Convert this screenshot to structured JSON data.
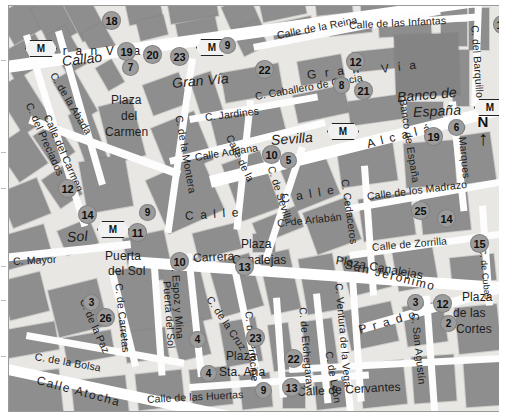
{
  "map": {
    "title": "Madrid city centre street map",
    "compass": {
      "label": "N",
      "arrow": "↑"
    },
    "metro_symbol": "M",
    "colors": {
      "background": "#e9e7e4",
      "block": "#8e8e8e",
      "road": "#fdfdfd",
      "poi_fill": "#9c9c9c",
      "text": "#1d1d1d"
    }
  },
  "streets": [
    {
      "id": "gran-via-1",
      "text": "G r a n   V i a"
    },
    {
      "id": "gran-via-2",
      "text": "Gran Vía"
    },
    {
      "id": "gran-via-3",
      "text": "G r a n"
    },
    {
      "id": "gran-via-4",
      "text": "V í a"
    },
    {
      "id": "callao",
      "text": "Callao"
    },
    {
      "id": "c-de-la-abada",
      "text": "C. de la Abada"
    },
    {
      "id": "calle-del-carmen",
      "text": "Calle  del  Carmen"
    },
    {
      "id": "c-del-preciados",
      "text": "C. del Preciados"
    },
    {
      "id": "c-de-la-montera",
      "text": "C. de la Montera"
    },
    {
      "id": "c-jardines",
      "text": "C. Jardines"
    },
    {
      "id": "calle-aduana",
      "text": "Calle Aduana"
    },
    {
      "id": "calle-de-la",
      "text": "Calle de la"
    },
    {
      "id": "calle",
      "text": "C a l l e"
    },
    {
      "id": "calle-de-la-reina",
      "text": "Calle  de  la  Reina"
    },
    {
      "id": "calle-infantas",
      "text": "Calle de las Infantas"
    },
    {
      "id": "c-caballero-gracia",
      "text": "C. Caballero de Gracia"
    },
    {
      "id": "banco-de-espana",
      "text": "Banco de España"
    },
    {
      "id": "c-del-barquillo",
      "text": "C. del Barquillo"
    },
    {
      "id": "c-marques",
      "text": "C. Marques"
    },
    {
      "id": "sevilla",
      "text": "Sevilla"
    },
    {
      "id": "alcala",
      "text": "A l c a l á"
    },
    {
      "id": "c-de-sevilla",
      "text": "C. de Sevilla"
    },
    {
      "id": "c-de-arlaban",
      "text": "C. de Arlabán"
    },
    {
      "id": "c-cedaceros",
      "text": "C. Cedaceros"
    },
    {
      "id": "calle-madrazo",
      "text": "Calle de los Madrazo"
    },
    {
      "id": "calle-zorrilla",
      "text": "Calle de Zorrilla"
    },
    {
      "id": "sol",
      "text": "Sol"
    },
    {
      "id": "puerta-del-sol",
      "text": "Puerta del Sol"
    },
    {
      "id": "c-mayor",
      "text": "C. Mayor"
    },
    {
      "id": "c-espoz-y-mina",
      "text": "C. Espoz y Mina"
    },
    {
      "id": "carrera",
      "text": "Carrera"
    },
    {
      "id": "plaza-canalejas",
      "text": "Plaza Canalejas"
    },
    {
      "id": "san-jeronimo",
      "text": "San  Jerónimo"
    },
    {
      "id": "c-de-la-cruz",
      "text": "C. de la Cruz"
    },
    {
      "id": "c-de-carretas",
      "text": "C. de Carretas"
    },
    {
      "id": "c-de-la-paz",
      "text": "C. de la Paz"
    },
    {
      "id": "c-de-la-bolsa",
      "text": "C. de la Bolsa"
    },
    {
      "id": "calle-atocha",
      "text": "Calle  Atocha"
    },
    {
      "id": "calle-huertas",
      "text": "Calle de las Huertas"
    },
    {
      "id": "plaza-sta-ana",
      "text": "Plaza Sta. Ana"
    },
    {
      "id": "c-del-principe",
      "text": "C. del Príncipe"
    },
    {
      "id": "c-de-etchegaray",
      "text": "C. de Etchegaray"
    },
    {
      "id": "c-ventura-de-la-vega",
      "text": "C. Ventura de la Vega"
    },
    {
      "id": "c-de-leon",
      "text": "C. de León"
    },
    {
      "id": "prado",
      "text": "P r a d o"
    },
    {
      "id": "c-san-agustin",
      "text": "C. San Agustín"
    },
    {
      "id": "calle-de-cervantes",
      "text": "Calle  de  Cervantes"
    },
    {
      "id": "plaza-de-las-cortes",
      "text": "Plaza de las Cortes"
    },
    {
      "id": "plaza-del-carmen",
      "text": "Plaza del Carmen"
    },
    {
      "id": "c-de-cedas",
      "text": "C. de Cubas"
    },
    {
      "id": "c-calle2",
      "text": "C a l l e"
    }
  ],
  "places": [
    {
      "id": "plaza-del-carmen",
      "lines": [
        "Plaza",
        "del",
        "Carmen"
      ]
    },
    {
      "id": "puerta-del-sol",
      "lines": [
        "Puerta",
        "del Sol"
      ]
    },
    {
      "id": "plaza-canalejas",
      "lines": [
        "Plaza",
        "Canalejas"
      ]
    },
    {
      "id": "plaza-sta-ana",
      "lines": [
        "Plaza",
        "Sta. Ana"
      ]
    },
    {
      "id": "plaza-de-las-cortes",
      "lines": [
        "Plaza",
        "de las",
        "Cortes"
      ]
    },
    {
      "id": "banco-de-espana",
      "lines": [
        "Banco de",
        "España"
      ]
    }
  ],
  "pois": [
    {
      "n": "18",
      "x": 102,
      "y": 14
    },
    {
      "n": "19",
      "x": 117,
      "y": 45
    },
    {
      "n": "20",
      "x": 143,
      "y": 48
    },
    {
      "n": "23",
      "x": 170,
      "y": 50
    },
    {
      "n": "7",
      "x": 122,
      "y": 62
    },
    {
      "n": "9",
      "x": 219,
      "y": 40
    },
    {
      "n": "12",
      "x": 346,
      "y": 55
    },
    {
      "n": "18",
      "x": 493,
      "y": 18
    },
    {
      "n": "22",
      "x": 255,
      "y": 63
    },
    {
      "n": "8",
      "x": 333,
      "y": 80
    },
    {
      "n": "21",
      "x": 354,
      "y": 84
    },
    {
      "n": "19",
      "x": 424,
      "y": 130
    },
    {
      "n": "6",
      "x": 448,
      "y": 122
    },
    {
      "n": "12",
      "x": 58,
      "y": 182
    },
    {
      "n": "14",
      "x": 78,
      "y": 208
    },
    {
      "n": "9",
      "x": 139,
      "y": 207
    },
    {
      "n": "11",
      "x": 128,
      "y": 226
    },
    {
      "n": "10",
      "x": 262,
      "y": 148
    },
    {
      "n": "5",
      "x": 280,
      "y": 155
    },
    {
      "n": "25",
      "x": 411,
      "y": 204
    },
    {
      "n": "14",
      "x": 437,
      "y": 212
    },
    {
      "n": "15",
      "x": 470,
      "y": 237
    },
    {
      "n": "10",
      "x": 170,
      "y": 255
    },
    {
      "n": "13",
      "x": 235,
      "y": 260
    },
    {
      "n": "3",
      "x": 83,
      "y": 297
    },
    {
      "n": "26",
      "x": 96,
      "y": 311
    },
    {
      "n": "23",
      "x": 246,
      "y": 331
    },
    {
      "n": "4",
      "x": 189,
      "y": 334
    },
    {
      "n": "4",
      "x": 200,
      "y": 368
    },
    {
      "n": "22",
      "x": 284,
      "y": 352
    },
    {
      "n": "9",
      "x": 255,
      "y": 385
    },
    {
      "n": "13",
      "x": 282,
      "y": 381
    },
    {
      "n": "3",
      "x": 407,
      "y": 297
    },
    {
      "n": "12",
      "x": 433,
      "y": 297
    },
    {
      "n": "2",
      "x": 440,
      "y": 318
    }
  ],
  "metro_stations": [
    {
      "id": "metro-callao",
      "x": 24,
      "y": 42
    },
    {
      "id": "metro-granvia",
      "x": 195,
      "y": 40
    },
    {
      "id": "metro-sol",
      "x": 96,
      "y": 222
    },
    {
      "id": "metro-sevilla",
      "x": 326,
      "y": 124
    },
    {
      "id": "metro-banco",
      "x": 473,
      "y": 100
    }
  ]
}
